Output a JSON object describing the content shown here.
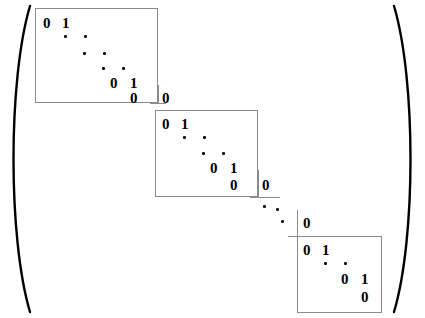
{
  "figure": {
    "type": "block-diagonal-matrix",
    "bracket": {
      "left": "(",
      "right": ")"
    },
    "ink_color": "#000000",
    "rule_color": "#8a8a8a",
    "background": "#ffffff"
  },
  "blocks": [
    {
      "name": "jordan-block-1",
      "box": {
        "x": 35,
        "y": 8,
        "w": 123,
        "h": 95
      },
      "top_row": {
        "diag": "0",
        "super": "1"
      },
      "bottom_row": {
        "diag": "0",
        "super": "1"
      },
      "last_row": {
        "diag": "0"
      },
      "dot_rows": 3,
      "dots": [
        {
          "x": 64,
          "y": 35
        },
        {
          "x": 84,
          "y": 35
        },
        {
          "x": 83,
          "y": 52
        },
        {
          "x": 103,
          "y": 52
        },
        {
          "x": 102,
          "y": 67
        },
        {
          "x": 122,
          "y": 67
        }
      ],
      "labels": {
        "top_diag": {
          "x": 43,
          "y": 16
        },
        "top_super": {
          "x": 62,
          "y": 16
        },
        "mid_diag": {
          "x": 110,
          "y": 76
        },
        "mid_super": {
          "x": 130,
          "y": 76
        },
        "last_diag": {
          "x": 130,
          "y": 91
        }
      }
    },
    {
      "name": "jordan-block-2",
      "box": {
        "x": 155,
        "y": 110,
        "w": 103,
        "h": 87
      },
      "top_row": {
        "diag": "0",
        "super": "1"
      },
      "bottom_row": {
        "diag": "0",
        "super": "1"
      },
      "last_row": {
        "diag": "0"
      },
      "dot_rows": 2,
      "dots": [
        {
          "x": 183,
          "y": 136
        },
        {
          "x": 203,
          "y": 136
        },
        {
          "x": 202,
          "y": 152
        },
        {
          "x": 222,
          "y": 152
        }
      ],
      "labels": {
        "top_diag": {
          "x": 162,
          "y": 117
        },
        "top_super": {
          "x": 181,
          "y": 117
        },
        "mid_diag": {
          "x": 210,
          "y": 161
        },
        "mid_super": {
          "x": 230,
          "y": 161
        },
        "last_diag": {
          "x": 230,
          "y": 178
        }
      }
    },
    {
      "name": "jordan-block-3",
      "box": {
        "x": 297,
        "y": 236,
        "w": 85,
        "h": 77
      },
      "top_row": {
        "diag": "0",
        "super": "1"
      },
      "bottom_row": {
        "diag": "0",
        "super": "1"
      },
      "last_row": {
        "diag": "0"
      },
      "dot_rows": 1,
      "dots": [
        {
          "x": 324,
          "y": 262
        },
        {
          "x": 344,
          "y": 262
        }
      ],
      "labels": {
        "top_diag": {
          "x": 303,
          "y": 243
        },
        "top_super": {
          "x": 322,
          "y": 243
        },
        "mid_diag": {
          "x": 341,
          "y": 272
        },
        "mid_super": {
          "x": 361,
          "y": 272
        },
        "last_diag": {
          "x": 361,
          "y": 290
        }
      }
    }
  ],
  "zero_markers": [
    {
      "name": "zero-upper-right-1",
      "text": "0",
      "x": 162,
      "y": 91
    },
    {
      "name": "zero-upper-right-2",
      "text": "0",
      "x": 262,
      "y": 178
    },
    {
      "name": "zero-upper-right-3",
      "text": "0",
      "x": 303,
      "y": 216
    }
  ],
  "corner_rules": [
    {
      "name": "corner-rule-v-1",
      "x": 158,
      "y": 85,
      "w": 1,
      "h": 18
    },
    {
      "name": "corner-rule-h-1",
      "x": 150,
      "y": 103,
      "w": 16,
      "h": 1
    },
    {
      "name": "corner-rule-v-2",
      "x": 258,
      "y": 170,
      "w": 1,
      "h": 27
    },
    {
      "name": "corner-rule-h-2",
      "x": 250,
      "y": 197,
      "w": 30,
      "h": 1
    },
    {
      "name": "corner-rule-v-3",
      "x": 297,
      "y": 210,
      "w": 1,
      "h": 26
    },
    {
      "name": "corner-rule-h-3",
      "x": 288,
      "y": 236,
      "w": 18,
      "h": 1
    }
  ],
  "ellipsis_between_blocks": [
    {
      "name": "inter-block-ellipsis",
      "dots": [
        {
          "x": 263,
          "y": 205
        },
        {
          "x": 276,
          "y": 208
        },
        {
          "x": 281,
          "y": 220
        }
      ]
    }
  ],
  "parentheses": {
    "left": {
      "name": "left-paren",
      "path": "M 30 6 C 8 80 8 238 30 312"
    },
    "right": {
      "name": "right-paren",
      "path": "M 394 6 C 416 80 416 238 394 312"
    },
    "stroke_width": 2.4
  }
}
